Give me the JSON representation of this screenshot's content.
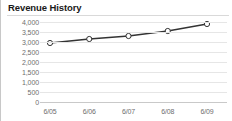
{
  "widget": {
    "title": "Revenue History",
    "background_color": "#ffffff",
    "border_color": "#c8c8c8",
    "rule_color": "#d9d9d9"
  },
  "chart_data": {
    "type": "line",
    "title": "Revenue History",
    "xlabel": "",
    "ylabel": "",
    "categories": [
      "6/05",
      "6/06",
      "6/07",
      "6/08",
      "6/09"
    ],
    "values": [
      2950,
      3150,
      3300,
      3550,
      3900
    ],
    "series": [
      {
        "name": "Revenue",
        "values": [
          2950,
          3150,
          3300,
          3550,
          3900
        ]
      }
    ],
    "ylim": [
      0,
      4000
    ],
    "ytick_values": [
      0,
      500,
      1000,
      1500,
      2000,
      2500,
      3000,
      3500,
      4000
    ],
    "ytick_labels": [
      "0",
      "500",
      "1,000",
      "1,500",
      "2,000",
      "2,500",
      "3,000",
      "3,500",
      "4,000"
    ],
    "grid": true,
    "legend": false,
    "legend_position": "none",
    "line_color": "#333333",
    "marker_fill": "#ffffff",
    "marker_edge_color": "#333333",
    "gridline_color": "#e6e6e6",
    "axis_color": "#c9c9c9",
    "tick_label_color": "#6e6e6e"
  }
}
